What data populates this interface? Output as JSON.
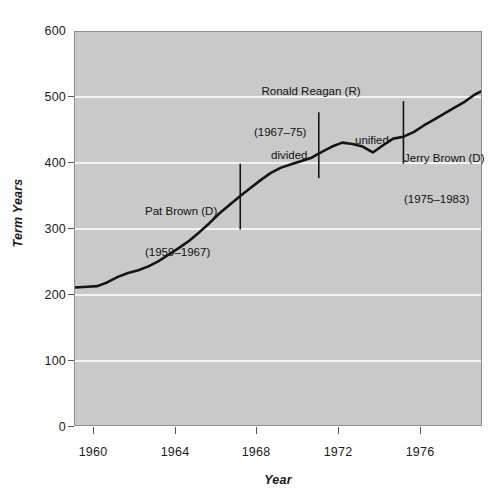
{
  "chart_data": {
    "type": "line",
    "title": "",
    "xlabel": "Year",
    "ylabel": "Term Years",
    "xlim": [
      1958.9,
      1978.9
    ],
    "ylim": [
      0,
      600
    ],
    "grid": true,
    "legend_position": "none",
    "x_ticks": [
      1960,
      1964,
      1968,
      1972,
      1976
    ],
    "x_tick_labels": [
      "1960",
      "1964",
      "1968",
      "1972",
      "1976"
    ],
    "y_ticks": [
      0,
      100,
      200,
      300,
      400,
      500,
      600
    ],
    "y_tick_labels": [
      "0",
      "100",
      "200",
      "300",
      "400",
      "500",
      "600"
    ],
    "series": [
      {
        "name": "Term Years",
        "x": [
          1958.9,
          1959.5,
          1960.0,
          1960.5,
          1961.0,
          1961.5,
          1962.0,
          1962.5,
          1963.0,
          1963.5,
          1964.0,
          1964.5,
          1965.0,
          1965.5,
          1966.0,
          1966.5,
          1967.0,
          1967.5,
          1968.0,
          1968.5,
          1969.0,
          1969.5,
          1970.0,
          1970.5,
          1971.0,
          1971.5,
          1972.0,
          1972.5,
          1973.0,
          1973.5,
          1974.0,
          1974.5,
          1975.0,
          1975.5,
          1976.0,
          1976.5,
          1977.0,
          1977.5,
          1978.0,
          1978.5,
          1978.9
        ],
        "y": [
          212,
          213,
          214,
          220,
          228,
          234,
          238,
          244,
          252,
          262,
          272,
          283,
          296,
          310,
          325,
          338,
          351,
          363,
          375,
          386,
          394,
          399,
          404,
          409,
          418,
          426,
          432,
          430,
          426,
          417,
          428,
          438,
          441,
          448,
          458,
          467,
          476,
          485,
          494,
          505,
          511
        ]
      }
    ],
    "markers": [
      {
        "id": "pat-brown-marker",
        "x": 1967.0,
        "y_top": 400,
        "y_bottom": 300
      },
      {
        "id": "reagan-start-marker",
        "x": 1970.85,
        "y_top": 478,
        "y_bottom": 378
      },
      {
        "id": "reagan-end-marker",
        "x": 1975.0,
        "y_top": 495,
        "y_bottom": 400
      }
    ],
    "annotations": [
      {
        "id": "reagan-label",
        "line1": "Ronald Reagan (R)",
        "line2": "(1967–75)",
        "x": 1971.0,
        "y": 538
      },
      {
        "id": "pat-brown-label",
        "line1": "Pat Brown (D)",
        "line2": "(1959–1967)",
        "x": 1964.5,
        "y": 365
      },
      {
        "id": "jerry-brown-label",
        "line1": "Jerry Brown (D)",
        "line2": "(1975–1983)",
        "x": 1977.0,
        "y": 432
      },
      {
        "id": "divided-label",
        "line1": "divided",
        "line2": "",
        "x": 1969.5,
        "y": 446
      },
      {
        "id": "unified-label",
        "line1": "unified",
        "line2": "",
        "x": 1973.4,
        "y": 465
      }
    ],
    "colors": {
      "plot_background": "#c9c9c9",
      "gridline": "#f3f3f3",
      "series_line": "#141414",
      "marker_line": "#141414",
      "text": "#1a1a1a",
      "page_background": "#ffffff",
      "frame_border": "#8e8e8e"
    }
  }
}
